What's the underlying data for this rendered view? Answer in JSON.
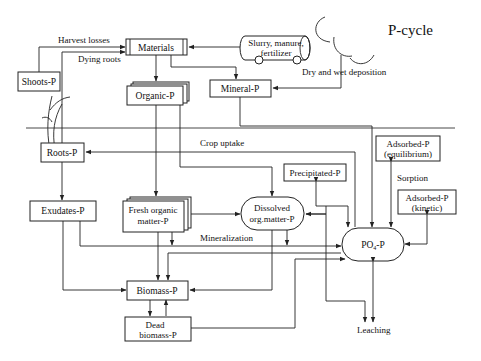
{
  "title": "P-cycle",
  "nodes": {
    "materials": "Materials",
    "slurry_line1": "Slurry, manure,",
    "slurry_line2": "fertilizer",
    "shoots": "Shoots-P",
    "organic": "Organic-P",
    "mineral": "Mineral-P",
    "roots": "Roots-P",
    "adsorbed_eq_line1": "Adsorbed-P",
    "adsorbed_eq_line2": "(equilibrium)",
    "precipitated": "Precipitated-P",
    "adsorbed_kin_line1": "Adsorbed-P",
    "adsorbed_kin_line2": "(kinetic)",
    "exudates": "Exudates-P",
    "fresh_line1": "Fresh organic",
    "fresh_line2": "matter-P",
    "dissolved_line1": "Dissolved",
    "dissolved_line2": "org.matter-P",
    "po4_main": "PO",
    "po4_sub": "4",
    "po4_tail": "-P",
    "biomass": "Biomass-P",
    "dead_line1": "Dead",
    "dead_line2": "biomass-P"
  },
  "flows": {
    "harvest_losses": "Harvest losses",
    "dying_roots": "Dying roots",
    "dry_wet_deposition": "Dry and wet deposition",
    "crop_uptake": "Crop uptake",
    "sorption": "Sorption",
    "mineralization": "Mineralization",
    "leaching": "Leaching"
  },
  "colors": {
    "line": "#222222",
    "background": "#ffffff"
  }
}
